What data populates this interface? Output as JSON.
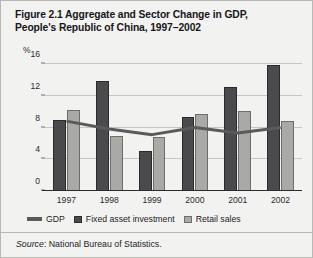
{
  "figure": {
    "title": "Figure 2.1  Aggregate and Sector Change in GDP, People's Republic of China, 1997–2002",
    "title_line1": "Figure 2.1  Aggregate and Sector Change in GDP,",
    "title_line2": "People's Republic of China, 1997–2002",
    "unit_label": "%",
    "source_prefix": "Source",
    "source_text": ": National Bureau of Statistics."
  },
  "colors": {
    "background": "#f2f2f0",
    "fixed_asset_investment": "#4a4a4c",
    "retail_sales": "#a9a9a6",
    "gdp_line": "#5a5a5c",
    "gridline": "#c6c6c2",
    "axis": "#2c2c2e",
    "text": "#1d1d1f"
  },
  "chart_data": {
    "type": "bar",
    "title": "Figure 2.1  Aggregate and Sector Change in GDP, People's Republic of China, 1997–2002",
    "xlabel": "",
    "ylabel": "%",
    "ylim": [
      0,
      16
    ],
    "yticks": [
      "0",
      "4",
      "8",
      "12",
      "16"
    ],
    "ytick_values": [
      0,
      4,
      8,
      12,
      16
    ],
    "grid": true,
    "legend_position": "bottom",
    "categories": [
      "1997",
      "1998",
      "1999",
      "2000",
      "2001",
      "2002"
    ],
    "series": [
      {
        "name": "Fixed asset investment",
        "type": "bar",
        "color": "#4a4a4c",
        "values": [
          8.9,
          13.9,
          5.1,
          9.3,
          13.1,
          15.9
        ]
      },
      {
        "name": "Retail sales",
        "type": "bar",
        "color": "#a9a9a6",
        "values": [
          10.2,
          6.9,
          6.8,
          9.7,
          10.1,
          8.8
        ]
      },
      {
        "name": "GDP",
        "type": "line",
        "color": "#5a5a5c",
        "values": [
          8.8,
          7.8,
          7.1,
          8.0,
          7.3,
          8.0
        ]
      }
    ]
  },
  "legend": {
    "items": [
      {
        "label": "GDP",
        "marker": "line-swatch"
      },
      {
        "label": "Fixed asset investment",
        "marker": "dark-square-swatch"
      },
      {
        "label": "Retail sales",
        "marker": "light-square-swatch"
      }
    ]
  }
}
